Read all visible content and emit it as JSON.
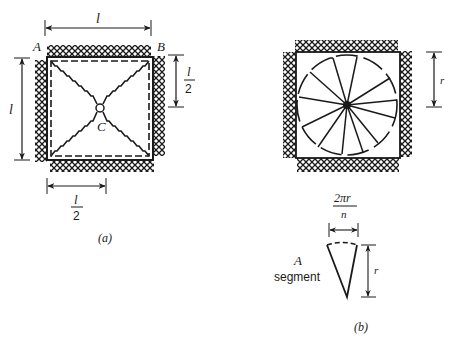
{
  "figure": {
    "panel_a": {
      "caption": "(a)",
      "corner_labels": {
        "top_left": "A",
        "top_right": "B"
      },
      "center_label": "C",
      "dimensions": {
        "top_width": "l",
        "left_height": "l",
        "right_half_numerator": "l",
        "right_half_denominator": "2",
        "bottom_half_numerator": "l",
        "bottom_half_denominator": "2"
      },
      "description": "Square slab with fixed (hatched) edges, dashed yield lines along the boundary and diagonal yield lines meeting at center C"
    },
    "panel_b": {
      "caption": "(b)",
      "radius_label": "r",
      "segment": {
        "arc_length_numerator": "2πr",
        "arc_length_denominator": "n",
        "radius_label": "r",
        "label_line1": "A",
        "label_line2": "segment"
      },
      "description": "Square slab with fixed edges and fan yield pattern of n radial segments within a circle of radius r"
    },
    "colors": {
      "ink": "#1a1a1a",
      "background": "#ffffff"
    }
  }
}
